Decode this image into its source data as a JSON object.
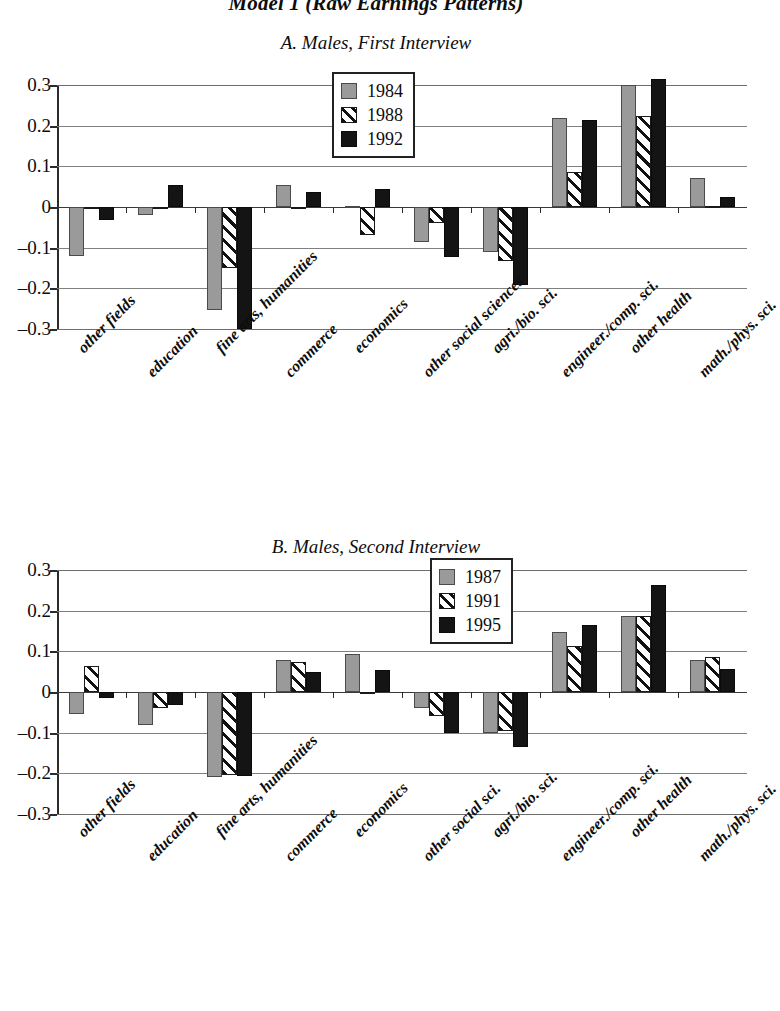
{
  "figure": {
    "title": "Model 1 (Raw Earnings Patterns)"
  },
  "panelA": {
    "title": "A. Males, First Interview",
    "legend": [
      {
        "label": "1984",
        "style": "solid-gray"
      },
      {
        "label": "1988",
        "style": "diagonal-hatch"
      },
      {
        "label": "1992",
        "style": "solid-black"
      }
    ]
  },
  "panelB": {
    "title": "B. Males, Second Interview",
    "legend": [
      {
        "label": "1987",
        "style": "solid-gray"
      },
      {
        "label": "1991",
        "style": "diagonal-hatch"
      },
      {
        "label": "1995",
        "style": "solid-black"
      }
    ]
  },
  "chart_data": [
    {
      "type": "bar",
      "title": "A. Males, First Interview",
      "xlabel": "",
      "ylabel": "",
      "ylim": [
        -0.3,
        0.3
      ],
      "yticks": [
        0.3,
        0.2,
        0.1,
        0,
        -0.1,
        -0.2,
        -0.3
      ],
      "ytick_labels": [
        "0.3",
        "0.2",
        "0.1",
        "0",
        "–0.1",
        "–0.2",
        "–0.3"
      ],
      "grid": true,
      "legend_position": "top-center",
      "categories": [
        "other fields",
        "education",
        "fine arts, humanities",
        "commerce",
        "economics",
        "other social  sciences",
        "agri./bio. sci.",
        "engineer./comp. sci.",
        "other health",
        "math./phys. sci."
      ],
      "series": [
        {
          "name": "1984",
          "values": [
            -0.12,
            -0.02,
            -0.253,
            0.055,
            0.003,
            -0.085,
            -0.11,
            0.218,
            0.3,
            0.072
          ]
        },
        {
          "name": "1988",
          "values": [
            0.0,
            0.0,
            -0.15,
            0.0,
            -0.068,
            -0.04,
            -0.132,
            0.085,
            0.223,
            0.003
          ]
        },
        {
          "name": "1992",
          "values": [
            -0.033,
            0.055,
            -0.3,
            0.036,
            0.045,
            -0.123,
            -0.192,
            0.213,
            0.315,
            0.025
          ]
        }
      ]
    },
    {
      "type": "bar",
      "title": "B. Males, Second Interview",
      "xlabel": "",
      "ylabel": "",
      "ylim": [
        -0.3,
        0.3
      ],
      "yticks": [
        0.3,
        0.2,
        0.1,
        0,
        -0.1,
        -0.2,
        -0.3
      ],
      "ytick_labels": [
        "0.3",
        "0.2",
        "0.1",
        "0",
        "–0.1",
        "–0.2",
        "–0.3"
      ],
      "grid": true,
      "legend_position": "top-center",
      "categories": [
        "other fields",
        "education",
        "fine arts, humanities",
        "commerce",
        "economics",
        "other social  sci.",
        "agri./bio. sci.",
        "engineer./comp. sci.",
        "other health",
        "math./phys. sci."
      ],
      "series": [
        {
          "name": "1987",
          "values": [
            -0.055,
            -0.082,
            -0.208,
            0.078,
            0.093,
            -0.04,
            -0.1,
            0.147,
            0.188,
            0.078
          ]
        },
        {
          "name": "1991",
          "values": [
            0.065,
            -0.04,
            -0.205,
            0.073,
            -0.005,
            -0.058,
            -0.095,
            0.113,
            0.188,
            0.085
          ]
        },
        {
          "name": "1995",
          "values": [
            -0.015,
            -0.033,
            -0.207,
            0.048,
            0.055,
            -0.1,
            -0.135,
            0.165,
            0.263,
            0.057
          ]
        }
      ]
    }
  ]
}
